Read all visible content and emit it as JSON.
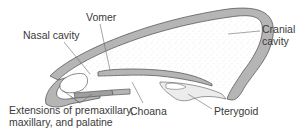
{
  "diagram": {
    "labels": {
      "nasal_cavity": "Nasal cavity",
      "vomer": "Vomer",
      "cranial_cavity_line1": "Cranial",
      "cranial_cavity_line2": "cavity",
      "extensions_line1": "Extensions of premaxillary,",
      "extensions_line2": "maxillary, and palatine",
      "choana": "Choana",
      "pterygoid": "Pterygoid"
    },
    "colors": {
      "bone": "#b5b5b5",
      "bone_outline": "#5a5a5a",
      "cavity_stipple": "#e8e8e8",
      "leader_line": "#6a6a6a",
      "text": "#3a3a3a"
    }
  }
}
